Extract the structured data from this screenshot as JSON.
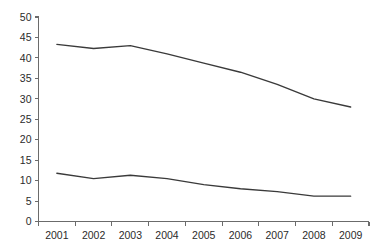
{
  "chart_data": {
    "type": "line",
    "title": "",
    "subtitle": "",
    "xlabel": "",
    "ylabel": "",
    "categories": [
      "2001",
      "2002",
      "2003",
      "2004",
      "2005",
      "2006",
      "2007",
      "2008",
      "2009"
    ],
    "series": [
      {
        "name": "upper-series",
        "color": "#3a3a3a",
        "values": [
          43.3,
          42.3,
          43.0,
          41.0,
          38.7,
          36.5,
          33.5,
          30.0,
          28.0
        ]
      },
      {
        "name": "lower-series",
        "color": "#3a3a3a",
        "values": [
          11.8,
          10.5,
          11.3,
          10.5,
          9.0,
          8.0,
          7.3,
          6.2,
          6.2
        ]
      }
    ],
    "ylim": [
      0,
      50
    ],
    "ytick_values": [
      0,
      5,
      10,
      15,
      20,
      25,
      30,
      35,
      40,
      45,
      50
    ],
    "ytick_labels": [
      "0",
      "5",
      "10",
      "15",
      "20",
      "25",
      "30",
      "35",
      "40",
      "45",
      "50"
    ],
    "grid": false,
    "legend": false,
    "legend_position": "none",
    "markers": false,
    "axis_color": "#6b6b6b",
    "text_color": "#2b2b2b",
    "background_color": "#ffffff"
  }
}
